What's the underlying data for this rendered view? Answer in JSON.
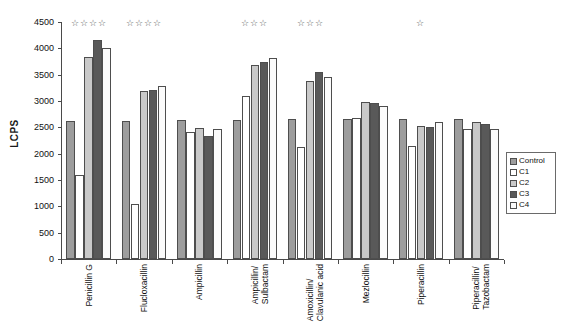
{
  "chart_data": {
    "type": "bar",
    "title": "",
    "subtitle": "",
    "xlabel": "",
    "ylabel": "LCPS",
    "ylim": [
      0,
      4500
    ],
    "ytick_step": 500,
    "yticks": [
      0,
      500,
      1000,
      1500,
      2000,
      2500,
      3000,
      3500,
      4000,
      4500
    ],
    "ytick_labels": [
      "0",
      "500",
      "1000",
      "1500",
      "2000",
      "2500",
      "3000",
      "3500",
      "4000",
      "4500"
    ],
    "grid": false,
    "legend_position": "right",
    "categories": [
      "Penicillin G",
      "Flucloxacillin",
      "Ampicillin",
      "Ampicillin/\nSulbactam",
      "Amoxicillin/\nClavulanic acid",
      "Mezlocillin",
      "Piperacillin",
      "Piperacillin/\nTazobactam"
    ],
    "series": [
      {
        "name": "Control",
        "color": "#9d9d9d",
        "values": [
          2630,
          2630,
          2635,
          2635,
          2650,
          2655,
          2650,
          2660
        ]
      },
      {
        "name": "C1",
        "color": "#ffffff",
        "values": [
          1600,
          1040,
          2420,
          3090,
          2120,
          2680,
          2150,
          2460
        ]
      },
      {
        "name": "C2",
        "color": "#c9c9c9",
        "values": [
          3830,
          3190,
          2480,
          3690,
          3380,
          2990,
          2520,
          2600
        ]
      },
      {
        "name": "C3",
        "color": "#595959",
        "values": [
          4160,
          3215,
          2330,
          3740,
          3545,
          2970,
          2510,
          2560
        ]
      },
      {
        "name": "C4",
        "color": "#fbfbfb",
        "values": [
          4010,
          3280,
          2460,
          3815,
          3450,
          2900,
          2610,
          2470
        ]
      }
    ],
    "annotations": {
      "marker": "☆",
      "stars_per_category": [
        4,
        4,
        0,
        3,
        3,
        0,
        1,
        0
      ]
    }
  },
  "legend": {
    "items": [
      {
        "label": "Control",
        "swatch": "#9d9d9d"
      },
      {
        "label": "C1",
        "swatch": "#ffffff"
      },
      {
        "label": "C2",
        "swatch": "#c9c9c9"
      },
      {
        "label": "C3",
        "swatch": "#595959"
      },
      {
        "label": "C4",
        "swatch": "#fbfbfb"
      }
    ]
  }
}
